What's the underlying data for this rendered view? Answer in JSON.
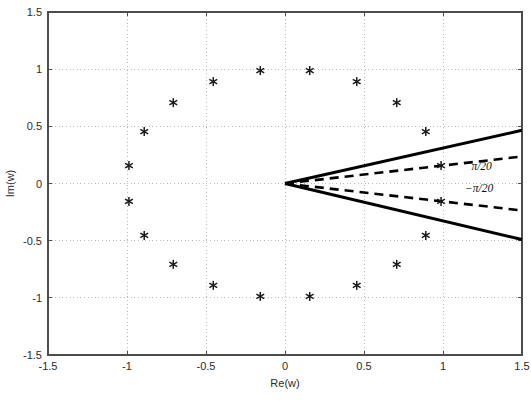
{
  "figure": {
    "background": "#ffffff",
    "axis_color": "#4d4d4d",
    "grid_color": "#b3b3b3",
    "marker_color": "#1a1a1a",
    "line_color": "#000000"
  },
  "chart_data": {
    "type": "scatter",
    "title": "",
    "xlabel": "Re(w)",
    "ylabel": "Im(w)",
    "xlim": [
      -1.5,
      1.5
    ],
    "ylim": [
      -1.5,
      1.5
    ],
    "xticks": [
      -1.5,
      -1,
      -0.5,
      0,
      0.5,
      1,
      1.5
    ],
    "yticks": [
      -1.5,
      -1,
      -0.5,
      0,
      0.5,
      1,
      1.5
    ],
    "xticklabels": [
      "-1.5",
      "-1",
      "-0.5",
      "0",
      "0.5",
      "1",
      "1.5"
    ],
    "yticklabels": [
      "-1.5",
      "-1",
      "-0.5",
      "0",
      "0.5",
      "1",
      "1.5"
    ],
    "grid": true,
    "grid_style": "dotted",
    "legend": null,
    "series": [
      {
        "name": "roots of unity",
        "marker": "asterisk",
        "marker_size": 7,
        "x": [
          0.9877,
          0.891,
          0.7071,
          0.454,
          0.1564,
          -0.1564,
          -0.454,
          -0.7071,
          -0.891,
          -0.9877,
          -0.9877,
          -0.891,
          -0.7071,
          -0.454,
          -0.1564,
          0.1564,
          0.454,
          0.7071,
          0.891,
          0.9877
        ],
        "y": [
          0.1564,
          0.454,
          0.7071,
          0.891,
          0.9877,
          0.9877,
          0.891,
          0.7071,
          0.454,
          0.1564,
          -0.1564,
          -0.454,
          -0.7071,
          -0.891,
          -0.9877,
          -0.9877,
          -0.891,
          -0.7071,
          -0.454,
          -0.1564
        ]
      }
    ],
    "annotations": [
      {
        "name": "wedge-solid-upper",
        "style": "solid",
        "from": [
          0,
          0
        ],
        "to": [
          1.5,
          0.465
        ],
        "angle_deg": 17.2,
        "label": ""
      },
      {
        "name": "wedge-solid-lower",
        "style": "solid",
        "from": [
          0,
          0
        ],
        "to": [
          1.5,
          -0.49
        ],
        "angle_deg": -18.1,
        "label": ""
      },
      {
        "name": "wedge-dashed-upper",
        "style": "dashed",
        "from": [
          0,
          0
        ],
        "to": [
          1.5,
          0.236
        ],
        "angle_deg": 9.0,
        "label": "π/20"
      },
      {
        "name": "wedge-dashed-lower",
        "style": "dashed",
        "from": [
          0,
          0
        ],
        "to": [
          1.5,
          -0.236
        ],
        "angle_deg": -9.0,
        "label": "−π/20"
      }
    ],
    "annotation_labels": {
      "upper": "π/20",
      "lower": "−π/20",
      "upper_pos": [
        1.18,
        0.115
      ],
      "lower_pos": [
        1.14,
        -0.075
      ]
    }
  }
}
